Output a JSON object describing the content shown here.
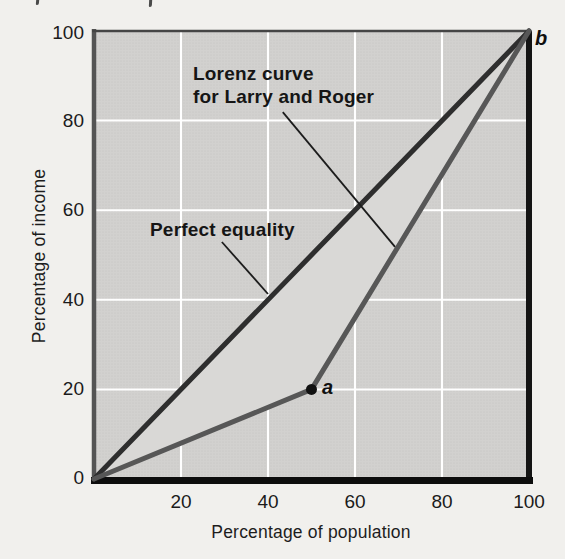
{
  "chart_data": {
    "type": "line",
    "xlabel": "Percentage of population",
    "ylabel": "Percentage of income",
    "xlim": [
      0,
      100
    ],
    "ylim": [
      0,
      100
    ],
    "xticks": [
      20,
      40,
      60,
      80,
      100
    ],
    "yticks": [
      0,
      20,
      40,
      60,
      80,
      100
    ],
    "grid": true,
    "legend_position": "none",
    "series": [
      {
        "name": "Perfect equality",
        "points": [
          [
            0,
            0
          ],
          [
            100,
            100
          ]
        ],
        "color": "#2e2e2e",
        "width": 5
      },
      {
        "name": "Lorenz curve for Larry and Roger",
        "points": [
          [
            0,
            0
          ],
          [
            50,
            20
          ],
          [
            100,
            100
          ]
        ],
        "color": "#575757",
        "width": 5
      }
    ],
    "gap_area_between_curves": [
      [
        0,
        0
      ],
      [
        50,
        20
      ],
      [
        100,
        100
      ]
    ],
    "markers": [
      {
        "label": "a",
        "x": 50,
        "y": 20,
        "dot": true
      },
      {
        "label": "b",
        "x": 100,
        "y": 100,
        "dot": false
      }
    ],
    "annotations": [
      {
        "lines": [
          "Lorenz curve",
          "for Larry and Roger"
        ],
        "leader_from": [
          43.4,
          81.9
        ],
        "leader_to": [
          69.2,
          51.8
        ]
      },
      {
        "lines": [
          "Perfect equality"
        ],
        "leader_from": [
          29.4,
          52.9
        ],
        "leader_to": [
          40.0,
          41.3
        ]
      }
    ],
    "colors": {
      "page_background": "#f1f0ed",
      "plot_background": "#d2d1cf",
      "plot_dot_texture": "#c5c4c2",
      "between_curves_fill": "#d9d8d6",
      "gridline": "#ffffff",
      "leader_line": "#1c1c1c",
      "marker_dot": "#111111",
      "axis_border_left": "#545454",
      "axis_border_top": "#454545",
      "axis_border_right": "#141414",
      "axis_border_bottom": "#0d0d0d"
    }
  }
}
